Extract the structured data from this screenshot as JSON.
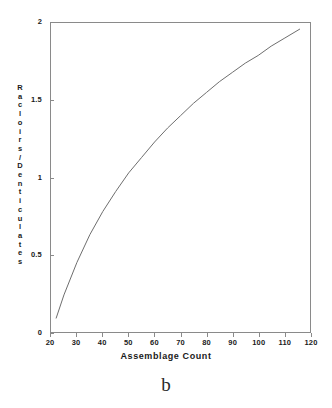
{
  "chart_data": {
    "type": "line",
    "title": "",
    "subtitle": "",
    "xlabel": "Assemblage Count",
    "ylabel": "Racloirs/Denticulates",
    "xlim": [
      20,
      120
    ],
    "ylim": [
      0,
      2
    ],
    "xticks": [
      20,
      30,
      40,
      50,
      60,
      70,
      80,
      90,
      100,
      110,
      120
    ],
    "xtick_labels": [
      "20",
      "30",
      "40",
      "50",
      "60",
      "70",
      "80",
      "90",
      "100",
      "110",
      "120"
    ],
    "yticks": [
      0,
      0.5,
      1,
      1.5,
      2
    ],
    "ytick_labels": [
      "0",
      "0.5",
      "1",
      "1.5",
      "2"
    ],
    "grid": false,
    "legend": "none",
    "line_color": "#6e6e6e",
    "frame_color": "#8a8a8a",
    "series": [
      {
        "name": "Racloirs/Denticulates",
        "x": [
          22,
          25,
          30,
          35,
          40,
          45,
          50,
          55,
          60,
          65,
          70,
          75,
          80,
          85,
          90,
          95,
          100,
          105,
          110,
          116
        ],
        "values": [
          0.09,
          0.24,
          0.45,
          0.63,
          0.78,
          0.91,
          1.03,
          1.13,
          1.23,
          1.32,
          1.4,
          1.48,
          1.55,
          1.62,
          1.68,
          1.74,
          1.79,
          1.85,
          1.9,
          1.96
        ]
      }
    ]
  },
  "axes": {
    "y_title_letters": [
      "R",
      "a",
      "c",
      "l",
      "o",
      "i",
      "r",
      "s",
      "/",
      "D",
      "e",
      "n",
      "t",
      "i",
      "c",
      "u",
      "l",
      "a",
      "t",
      "e",
      "s"
    ]
  },
  "caption": {
    "label": "b"
  }
}
